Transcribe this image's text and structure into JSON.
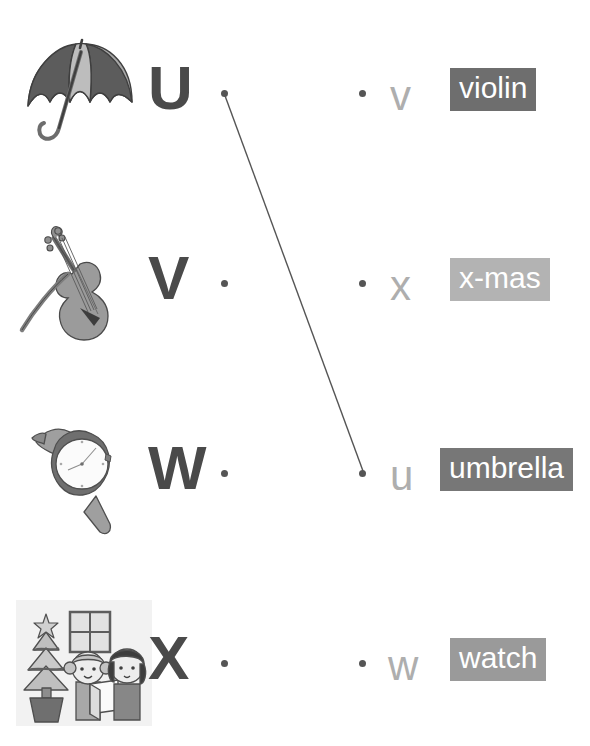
{
  "worksheet": {
    "title": "Alphabet Matching Worksheet U V W X",
    "width": 590,
    "height": 746,
    "background": "#ffffff",
    "capital_color": "#4a4a4a",
    "lowercase_color": "#aeaeae",
    "dot_color": "#555555",
    "line_color": "#555555"
  },
  "left_column": [
    {
      "capital": "U",
      "picture": "umbrella-illustration",
      "picture_label": "umbrella",
      "dot": "connector-dot"
    },
    {
      "capital": "V",
      "picture": "violin-illustration",
      "picture_label": "violin with bow",
      "dot": "connector-dot"
    },
    {
      "capital": "W",
      "picture": "wristwatch-illustration",
      "picture_label": "wrist watch",
      "dot": "connector-dot"
    },
    {
      "capital": "X",
      "picture": "christmas-illustration",
      "picture_label": "x-mas scene with tree and children",
      "dot": "connector-dot"
    }
  ],
  "right_column": [
    {
      "lowercase": "v",
      "word": "violin",
      "tag_background": "#6e6e6e",
      "tag_text_color": "#ffffff",
      "dot": "connector-dot"
    },
    {
      "lowercase": "x",
      "word": "x-mas",
      "tag_background": "#b3b3b3",
      "tag_text_color": "#ffffff",
      "dot": "connector-dot"
    },
    {
      "lowercase": "u",
      "word": "umbrella",
      "tag_background": "#777777",
      "tag_text_color": "#ffffff",
      "dot": "connector-dot"
    },
    {
      "lowercase": "w",
      "word": "watch",
      "tag_background": "#9a9a9a",
      "tag_text_color": "#ffffff",
      "dot": "connector-dot"
    }
  ],
  "connections": [
    {
      "from": "U",
      "to": "u",
      "x1": 224,
      "y1": 93,
      "x2": 363,
      "y2": 471
    }
  ]
}
